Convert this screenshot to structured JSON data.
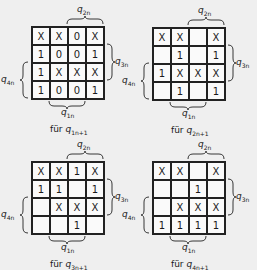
{
  "maps": [
    {
      "id": "q1",
      "caption_prefix": "für",
      "caption_var": "q",
      "caption_sub": "1n+1",
      "cells": [
        [
          "X",
          "X",
          "0",
          "X"
        ],
        [
          "1",
          "0",
          "0",
          "1"
        ],
        [
          "1",
          "X",
          "X",
          "X"
        ],
        [
          "1",
          "0",
          "0",
          "1"
        ]
      ]
    },
    {
      "id": "q2",
      "caption_prefix": "für",
      "caption_var": "q",
      "caption_sub": "2n+1",
      "cells": [
        [
          "X",
          "X",
          "",
          "X"
        ],
        [
          "",
          "1",
          "",
          "1"
        ],
        [
          "1",
          "X",
          "X",
          "X"
        ],
        [
          "",
          "1",
          "",
          "1"
        ]
      ]
    },
    {
      "id": "q3",
      "caption_prefix": "für",
      "caption_var": "q",
      "caption_sub": "3n+1",
      "cells": [
        [
          "X",
          "X",
          "1",
          "X"
        ],
        [
          "1",
          "1",
          "",
          "1"
        ],
        [
          "",
          "X",
          "X",
          "X"
        ],
        [
          "",
          "",
          "1",
          ""
        ]
      ]
    },
    {
      "id": "q4",
      "caption_prefix": "für",
      "caption_var": "q",
      "caption_sub": "4n+1",
      "cells": [
        [
          "X",
          "X",
          "",
          "X"
        ],
        [
          "",
          "",
          "1",
          ""
        ],
        [
          "",
          "X",
          "X",
          "X"
        ],
        [
          "1",
          "1",
          "1",
          "1"
        ]
      ]
    }
  ],
  "labels": {
    "top": {
      "var": "q",
      "sub": "2n"
    },
    "right": {
      "var": "q",
      "sub": "3n"
    },
    "left": {
      "var": "q",
      "sub": "4n"
    },
    "bottom": {
      "var": "q",
      "sub": "1n"
    }
  }
}
